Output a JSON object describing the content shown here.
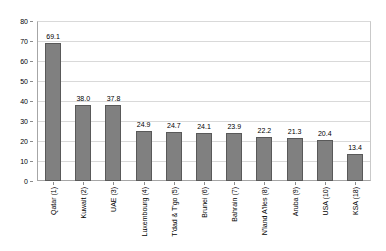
{
  "chart_data": {
    "type": "bar",
    "title": "",
    "subtitle": "",
    "xlabel": "",
    "ylabel": "",
    "ylim": [
      0,
      80
    ],
    "yticks": [
      0,
      10,
      20,
      30,
      40,
      50,
      60,
      70,
      80
    ],
    "grid": true,
    "legend": false,
    "legend_position": "none",
    "bar_color": "#808080",
    "bar_border_color": "#595959",
    "gridline_color": "#d9d9d9",
    "axis_color": "#a6a6a6",
    "background_color": "#ffffff",
    "categories": [
      "Qatar (1)",
      "Kuwait (2)",
      "UAE (3)",
      "Luxembourg (4)",
      "T'dad & T'go (5)",
      "Brunei (6)",
      "Bahrain (7)",
      "N'land A'lles (8)",
      "Aruba (9)",
      "USA (10)",
      "KSA (18)"
    ],
    "values": [
      69.1,
      38.0,
      37.8,
      24.9,
      24.7,
      24.1,
      23.9,
      22.2,
      21.3,
      20.4,
      13.4
    ],
    "value_labels": [
      "69.1",
      "38.0",
      "37.8",
      "24.9",
      "24.7",
      "24.1",
      "23.9",
      "22.2",
      "21.3",
      "20.4",
      "13.4"
    ],
    "ytick_labels": [
      "0",
      "10",
      "20",
      "30",
      "40",
      "50",
      "60",
      "70",
      "80"
    ]
  }
}
